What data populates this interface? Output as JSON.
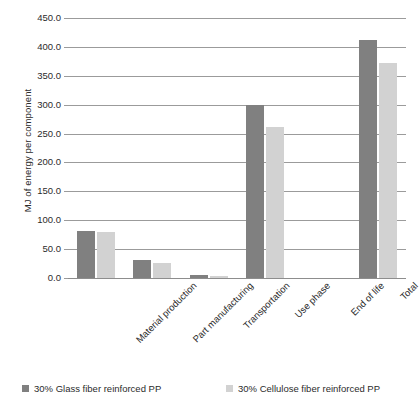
{
  "chart_data": {
    "type": "bar",
    "title": "",
    "subtitle": "",
    "xlabel": "",
    "ylabel": "MJ of energy per component",
    "ylim": [
      0,
      450
    ],
    "ytick_step": 50,
    "ytick_labels": [
      "0.0",
      "50.0",
      "100.0",
      "150.0",
      "200.0",
      "250.0",
      "300.0",
      "350.0",
      "400.0",
      "450.0"
    ],
    "ytick_values": [
      0,
      50,
      100,
      150,
      200,
      250,
      300,
      350,
      400,
      450
    ],
    "grid": true,
    "legend_position": "bottom",
    "categories": [
      "Material production",
      "Part manufacturing",
      "Transportation",
      "Use phase",
      "End of life",
      "Total"
    ],
    "series": [
      {
        "name": "30% Glass fiber reinforced PP",
        "color": "#808080",
        "values": [
          82,
          31,
          5,
          300,
          0,
          412
        ]
      },
      {
        "name": "30% Cellulose fiber reinforced PP",
        "color": "#d2d2d2",
        "values": [
          79,
          26,
          4,
          262,
          0,
          373
        ]
      }
    ]
  },
  "legend": {
    "items": [
      {
        "label": "30% Glass fiber reinforced PP",
        "color": "#808080"
      },
      {
        "label": "30% Cellulose fiber reinforced PP",
        "color": "#d2d2d2"
      }
    ]
  },
  "colors": {
    "series_dark": "#808080",
    "series_light": "#d2d2d2",
    "gridline": "#9b9b9b",
    "text": "#2b2b2b",
    "background": "#ffffff"
  }
}
